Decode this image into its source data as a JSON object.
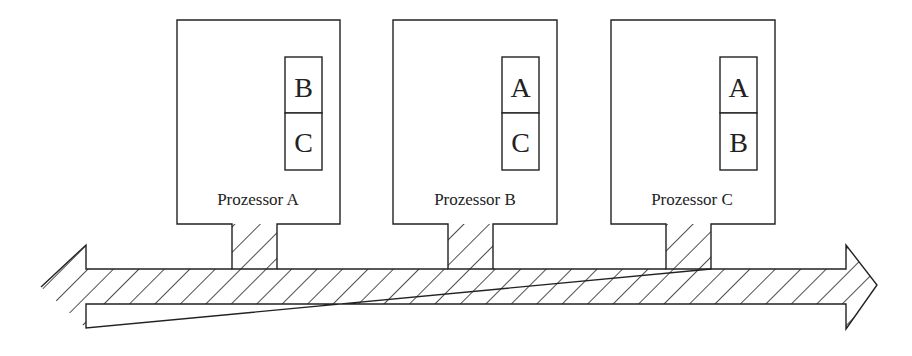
{
  "diagram": {
    "type": "shared-bus-processors",
    "processors": [
      {
        "label": "Prozessor A",
        "slots": [
          "B",
          "C"
        ]
      },
      {
        "label": "Prozessor B",
        "slots": [
          "A",
          "C"
        ]
      },
      {
        "label": "Prozessor C",
        "slots": [
          "A",
          "B"
        ]
      }
    ],
    "bus": {
      "style": "hatched double-headed arrow"
    },
    "colors": {
      "stroke": "#222222",
      "background": "#ffffff"
    }
  }
}
